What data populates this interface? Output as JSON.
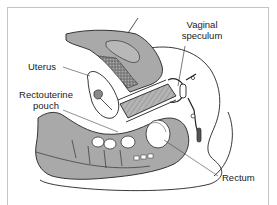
{
  "figure": {
    "type": "anatomical-sagittal-section",
    "labels": {
      "vaginal_speculum_line1": "Vaginal",
      "vaginal_speculum_line2": "speculum",
      "uterus": "Uterus",
      "rectouterine_line1": "Rectouterine",
      "rectouterine_line2": "pouch",
      "rectum": "Rectum"
    },
    "colors": {
      "tissue_fill": "#a9a9a9",
      "tissue_dark": "#6e6e6e",
      "outline": "#222222",
      "background": "#ffffff",
      "frame": "#c4c4c4",
      "label_text": "#1a1a1a"
    }
  }
}
